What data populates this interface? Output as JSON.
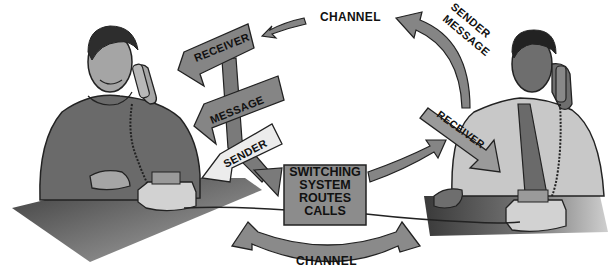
{
  "diagram": {
    "colors": {
      "arrow_dark": "#7a7a7a",
      "arrow_light": "#e6e6e6",
      "box_fill": "#8c8c8c",
      "desk": "#5a5a5a",
      "outline": "#222222",
      "background": "#ffffff"
    },
    "labels": {
      "channel_top": "CHANNEL",
      "channel_bottom": "CHANNEL",
      "receiver_left": "RECEIVER",
      "receiver_right": "RECEIVER",
      "message_left": "MESSAGE",
      "sender_left": "SENDER",
      "sender_right": "SENDER",
      "message_right": "MESSAGE"
    },
    "switch_box": {
      "lines": [
        "SWITCHING",
        "SYSTEM",
        "ROUTES",
        "CALLS"
      ]
    },
    "figures": {
      "left_person": "man on telephone (left)",
      "right_person": "man on telephone (right)"
    }
  }
}
